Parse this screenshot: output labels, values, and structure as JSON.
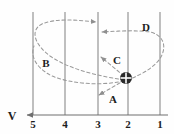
{
  "figure": {
    "kind": "trajectory-diagram",
    "width": 174,
    "height": 134,
    "background_color": "#fefefe",
    "line_color": "#8a8a8a",
    "axis_color": "#6f6f6f",
    "dash_color": "#9a9a9a",
    "text_color": "#1d1d1d",
    "marker_color": "#2a2a2a"
  },
  "axis": {
    "label": "V",
    "label_x": 12,
    "label_y": 117,
    "arrow_name": "left-arrow",
    "line_y": 115,
    "line_x_start": 26,
    "line_x_end": 168
  },
  "gridlines": [
    {
      "label": "5",
      "x": 33,
      "y_top": 12,
      "y_bottom": 115,
      "label_y": 119
    },
    {
      "label": "4",
      "x": 65,
      "y_top": 12,
      "y_bottom": 115,
      "label_y": 119
    },
    {
      "label": "3",
      "x": 98,
      "y_top": 12,
      "y_bottom": 115,
      "label_y": 119
    },
    {
      "label": "2",
      "x": 128,
      "y_top": 12,
      "y_bottom": 115,
      "label_y": 119
    },
    {
      "label": "1",
      "x": 160,
      "y_top": 12,
      "y_bottom": 115,
      "label_y": 119
    }
  ],
  "marker": {
    "name": "charged-particle",
    "glyph": "circle-with-cross",
    "x": 126,
    "y": 78,
    "radius": 6
  },
  "paths": [
    {
      "id": "A",
      "label": "A",
      "label_x": 113,
      "label_y": 99,
      "style": "dashed",
      "description": "short arrow from particle down-left",
      "d": "M 125 80 L 98 96",
      "arrow_at": "end"
    },
    {
      "id": "B",
      "label": "B",
      "label_x": 46,
      "label_y": 63,
      "style": "dashed",
      "description": "wide loop left around line 5 then right to line 3 at top",
      "d": "M 124 80 C 100 76 70 70 50 56 C 34 44 30 30 42 24 C 56 18 78 20 96 22",
      "arrow_at": "end"
    },
    {
      "id": "C",
      "label": "C",
      "label_x": 116,
      "label_y": 60,
      "style": "dashed",
      "description": "arrow from particle up-left to line 3",
      "d": "M 124 76 L 100 56",
      "arrow_at": "end"
    },
    {
      "id": "D",
      "label": "D",
      "label_x": 146,
      "label_y": 27,
      "style": "dashed",
      "description": "loop right around line 1 then left to line 3 near top",
      "d": "M 127 80 C 144 74 160 64 163 52 C 166 42 160 34 150 32 C 136 30 118 31 102 32",
      "arrow_at": "end"
    },
    {
      "id": "E",
      "label": "",
      "label_x": 0,
      "label_y": 0,
      "style": "dashed",
      "description": "long flat arc from particle sweeping left and down past line 5",
      "d": "M 124 81 C 100 86 72 84 52 76 C 36 68 30 56 34 46",
      "arrow_at": "none"
    }
  ],
  "labels": {
    "axis_v": "V",
    "path_a": "A",
    "path_b": "B",
    "path_c": "C",
    "path_d": "D"
  }
}
